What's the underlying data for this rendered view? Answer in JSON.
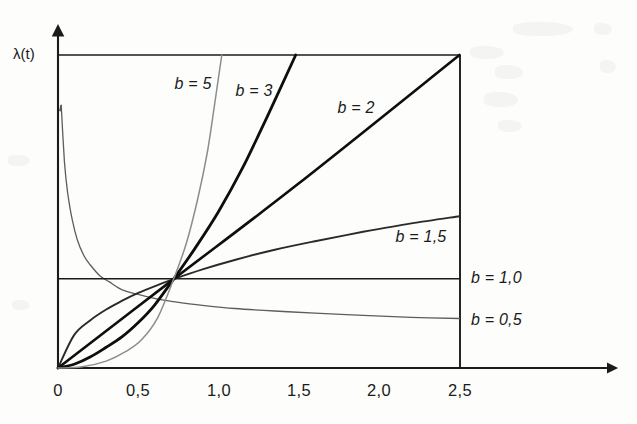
{
  "figure": {
    "kind": "line-chart",
    "background_color": "#fdfdfc",
    "ink_color": "#1b1b1b",
    "y_axis_title": "λ(t)",
    "y_axis_title_parts": {
      "symbol": "λ",
      "open": "(",
      "variable": "t",
      "close": ")"
    }
  },
  "chart_data": {
    "type": "line",
    "title": "",
    "subtitle": "",
    "xlabel": "",
    "ylabel": "λ(t)",
    "xlim": [
      0,
      2.5
    ],
    "ylim": [
      0,
      1.0
    ],
    "grid": false,
    "legend": "inline-curve-labels",
    "x_tick_labels": [
      "0",
      "0,5",
      "1,0",
      "1,5",
      "2,0",
      "2,5"
    ],
    "x_tick_values": [
      0,
      0.5,
      1.0,
      1.5,
      2.0,
      2.5
    ],
    "y_tick_labels": [],
    "annotations": [
      {
        "text": "b = 5",
        "x": 1.02,
        "y": 0.93,
        "label_px": {
          "x": 193,
          "y": 86
        }
      },
      {
        "text": "b = 3",
        "x": 1.2,
        "y": 0.88,
        "label_px": {
          "x": 254,
          "y": 93
        }
      },
      {
        "text": "b = 2",
        "x": 1.85,
        "y": 0.82,
        "label_px": {
          "x": 356,
          "y": 110
        }
      },
      {
        "text": "b = 1,5",
        "x": 2.25,
        "y": 0.43,
        "label_px": {
          "x": 421,
          "y": 239
        }
      },
      {
        "text": "b = 1,0",
        "x": 2.6,
        "y": 0.29,
        "label_px": {
          "x": 503,
          "y": 280
        }
      },
      {
        "text": "b = 0,5",
        "x": 2.6,
        "y": 0.16,
        "label_px": {
          "x": 503,
          "y": 322
        }
      }
    ],
    "series": [
      {
        "name": "b = 0,5",
        "b": 0.5,
        "color": "#5d5d5d",
        "width": 1.3,
        "x": [
          0.02,
          0.04,
          0.06,
          0.09,
          0.12,
          0.16,
          0.2,
          0.26,
          0.32,
          0.4,
          0.5,
          0.62,
          0.72,
          0.9,
          1.1,
          1.35,
          1.6,
          1.9,
          2.2,
          2.5
        ],
        "y": [
          0.84,
          0.66,
          0.56,
          0.47,
          0.41,
          0.36,
          0.33,
          0.295,
          0.275,
          0.25,
          0.235,
          0.22,
          0.212,
          0.2,
          0.19,
          0.182,
          0.175,
          0.168,
          0.162,
          0.158
        ]
      },
      {
        "name": "b = 1,0",
        "b": 1.0,
        "color": "#1b1b1b",
        "width": 1.6,
        "x": [
          0,
          2.5
        ],
        "y": [
          0.285,
          0.285
        ]
      },
      {
        "name": "b = 1,5",
        "b": 1.5,
        "color": "#2a2a2a",
        "width": 1.9,
        "x": [
          0,
          0.1,
          0.2,
          0.3,
          0.4,
          0.5,
          0.62,
          0.72,
          0.9,
          1.1,
          1.35,
          1.6,
          1.9,
          2.2,
          2.5
        ],
        "y": [
          0.0,
          0.105,
          0.152,
          0.187,
          0.215,
          0.24,
          0.265,
          0.284,
          0.315,
          0.345,
          0.378,
          0.405,
          0.435,
          0.462,
          0.485
        ]
      },
      {
        "name": "b = 2",
        "b": 2.0,
        "color": "#0e0e0e",
        "width": 2.6,
        "x": [
          0,
          0.72,
          1.5,
          2.5
        ],
        "y": [
          0.0,
          0.284,
          0.59,
          1.0
        ]
      },
      {
        "name": "b = 3",
        "b": 3.0,
        "color": "#0e0e0e",
        "width": 2.8,
        "x": [
          0,
          0.1,
          0.2,
          0.3,
          0.4,
          0.5,
          0.6,
          0.72,
          0.85,
          1.0,
          1.15,
          1.3,
          1.48
        ],
        "y": [
          0.0,
          0.012,
          0.035,
          0.066,
          0.1,
          0.145,
          0.2,
          0.284,
          0.38,
          0.5,
          0.64,
          0.8,
          1.0
        ]
      },
      {
        "name": "b = 5",
        "b": 5.0,
        "color": "#8d8d8d",
        "width": 1.5,
        "x": [
          0,
          0.15,
          0.3,
          0.42,
          0.52,
          0.62,
          0.72,
          0.8,
          0.87,
          0.93,
          0.98,
          1.02
        ],
        "y": [
          0.0,
          0.004,
          0.022,
          0.052,
          0.09,
          0.16,
          0.284,
          0.4,
          0.54,
          0.69,
          0.86,
          1.0
        ]
      }
    ]
  },
  "axes_pixel_geometry": {
    "origin": {
      "x": 58,
      "y": 368
    },
    "x_axis_end": {
      "x": 615,
      "y": 368
    },
    "y_axis_top": {
      "x": 58,
      "y": 30
    },
    "plot_right": 460,
    "plot_top": 55,
    "px_per_x_unit": 160.6,
    "tick_px": [
      58,
      138,
      218,
      298,
      379,
      459
    ]
  }
}
